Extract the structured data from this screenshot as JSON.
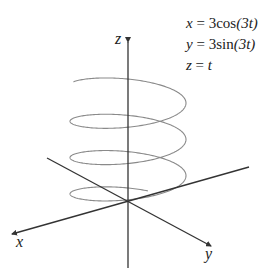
{
  "equations": [
    {
      "var": "x",
      "rhs": "= 3cos",
      "arg": "(3t)"
    },
    {
      "var": "y",
      "rhs": "= 3sin",
      "arg": "(3t)"
    },
    {
      "var": "z",
      "rhs": "= ",
      "arg": "t"
    }
  ],
  "axes": {
    "x_label": "x",
    "y_label": "y",
    "z_label": "z"
  },
  "colors": {
    "axis": "#333333",
    "curve": "#8a8a8a",
    "text": "#222222"
  },
  "geometry": {
    "origin": [
      128,
      202
    ],
    "z_axis": {
      "top": [
        128,
        42
      ],
      "bottom": [
        128,
        268
      ]
    },
    "x_axis": {
      "from": [
        249,
        167
      ],
      "to": [
        12,
        234
      ]
    },
    "y_axis": {
      "from": [
        47,
        158
      ],
      "to": [
        211,
        246
      ]
    },
    "helix": {
      "cx": 128,
      "a": 58,
      "b": 15,
      "z_top": 87,
      "z_bottom": 205,
      "turns": 3.25,
      "start_angle_deg": 200
    }
  }
}
